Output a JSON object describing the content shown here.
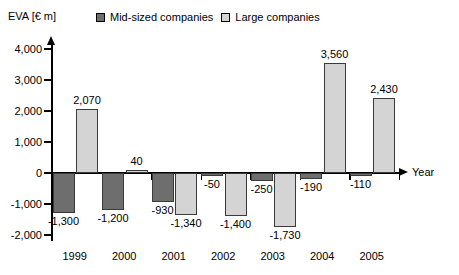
{
  "axis": {
    "y_title": "EVA [€ m]",
    "x_title": "Year"
  },
  "legend": {
    "items": [
      {
        "label": "Mid-sized companies",
        "color": "#6e6e6e",
        "swatch": "dark-square-icon"
      },
      {
        "label": "Large companies",
        "color": "#d4d4d4",
        "swatch": "light-square-icon"
      }
    ]
  },
  "yticks": [
    "4,000",
    "3,000",
    "2,000",
    "1,000",
    "0",
    "-1,000",
    "-2,000"
  ],
  "chart_data": {
    "type": "bar",
    "title": "",
    "xlabel": "Year",
    "ylabel": "EVA [€ m]",
    "categories": [
      "1999",
      "2000",
      "2001",
      "2002",
      "2003",
      "2004",
      "2005"
    ],
    "ylim": [
      -2000,
      4000
    ],
    "ytick_values": [
      4000,
      3000,
      2000,
      1000,
      0,
      -1000,
      -2000
    ],
    "grid": false,
    "legend_position": "top",
    "series": [
      {
        "name": "Mid-sized companies",
        "color": "#6e6e6e",
        "values": [
          -1300,
          -1200,
          -930,
          -50,
          -250,
          -190,
          -110
        ],
        "labels": [
          "-1,300",
          "-1,200",
          "-930",
          "-50",
          "-250",
          "-190",
          "-110"
        ]
      },
      {
        "name": "Large companies",
        "color": "#d4d4d4",
        "values": [
          2070,
          40,
          -1340,
          -1400,
          -1730,
          3560,
          2430
        ],
        "labels": [
          "2,070",
          "40",
          "-1,340",
          "-1,400",
          "-1,730",
          "3,560",
          "2,430"
        ]
      }
    ]
  }
}
